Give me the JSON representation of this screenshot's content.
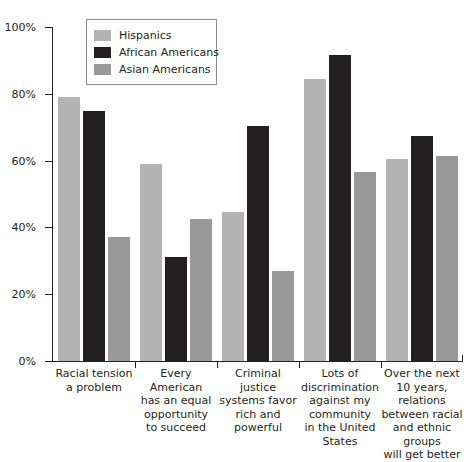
{
  "chart_data": {
    "type": "bar",
    "title": "",
    "subtitle": "",
    "xlabel": "",
    "ylabel": "",
    "ylim": [
      0,
      100
    ],
    "y_ticks": [
      "0%",
      "20%",
      "40%",
      "60%",
      "80%",
      "100%"
    ],
    "y_tick_values": [
      0,
      20,
      40,
      60,
      80,
      100
    ],
    "grid": false,
    "legend_position": "top-left-inside",
    "categories": [
      "Racial tension a problem",
      "Every American has an equal opportunity to succeed",
      "Criminal justice systems favor rich and powerful",
      "Lots of discrimination against my community in the United States",
      "Over the next 10 years, relations between racial and ethnic groups will get better"
    ],
    "category_lines": [
      [
        "Racial tension",
        "a problem"
      ],
      [
        "Every American",
        "has an equal",
        "opportunity",
        "to succeed"
      ],
      [
        "Criminal",
        "justice",
        "systems favor",
        "rich and",
        "powerful"
      ],
      [
        "Lots of",
        "discrimination",
        "against my",
        "community",
        "in the United",
        "States"
      ],
      [
        "Over the next",
        "10 years,",
        "relations",
        "between racial",
        "and ethnic",
        "groups",
        "will get better"
      ]
    ],
    "series": [
      {
        "name": "Hispanics",
        "color": "#b3b3b3",
        "values": [
          79,
          59,
          44.5,
          84.5,
          60.5
        ]
      },
      {
        "name": "African Americans",
        "color": "#231f20",
        "values": [
          75,
          31,
          70.5,
          91.5,
          67.5
        ]
      },
      {
        "name": "Asian Americans",
        "color": "#999999",
        "values": [
          37,
          42.5,
          27,
          56.5,
          61.5
        ]
      }
    ]
  },
  "legend": {
    "items": [
      {
        "label": "Hispanics",
        "color": "#b3b3b3"
      },
      {
        "label": "African Americans",
        "color": "#231f20"
      },
      {
        "label": "Asian Americans",
        "color": "#999999"
      }
    ]
  },
  "axis": {
    "y_labels": [
      "100%",
      "80%",
      "60%",
      "40%",
      "20%",
      "0%"
    ]
  }
}
